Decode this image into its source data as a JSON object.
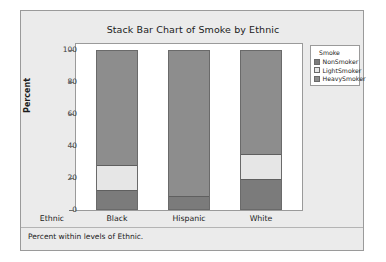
{
  "chart_data": {
    "type": "bar",
    "stacked": true,
    "stack_total": 100,
    "title": "Stack Bar Chart of Smoke by Ethnic",
    "xlabel": "Ethnic",
    "ylabel": "Percent",
    "categories": [
      "Black",
      "Hispanic",
      "White"
    ],
    "ylim": [
      0,
      100
    ],
    "yticks": [
      0,
      20,
      40,
      60,
      80,
      100
    ],
    "ytick_labels": [
      "0",
      "20",
      "40",
      "60",
      "80",
      "100"
    ],
    "grid": false,
    "legend_position": "right",
    "legend_title": "Smoke",
    "series": [
      {
        "name": "NonSmoker",
        "color": "#7b7b7b",
        "values": [
          12,
          8,
          19
        ]
      },
      {
        "name": "LightSmoker",
        "color": "#e6e6e6",
        "values": [
          16,
          0,
          16
        ]
      },
      {
        "name": "HeavySmoker",
        "color": "#8d8d8d",
        "values": [
          72,
          92,
          65
        ]
      }
    ],
    "footnote": "Percent within levels of Ethnic."
  },
  "chart": {
    "title": "Stack Bar Chart of Smoke by Ethnic",
    "y_axis_title": "Percent",
    "x_axis_row_label": "Ethnic",
    "footnote": "Percent within levels of Ethnic.",
    "y_ticks": [
      "100",
      "80",
      "60",
      "40",
      "20",
      "0"
    ],
    "categories": [
      "Black",
      "Hispanic",
      "White"
    ],
    "legend": {
      "title": "Smoke",
      "items": [
        {
          "label": "NonSmoker",
          "color": "#7b7b7b"
        },
        {
          "label": "LightSmoker",
          "color": "#e6e6e6"
        },
        {
          "label": "HeavySmoker",
          "color": "#8d8d8d"
        }
      ]
    },
    "colors": {
      "panel_background": "#ebebeb",
      "plot_background": "#ffffff",
      "frame_border": "#9a9a9a",
      "bar_border": "#6a6a6a",
      "text": "#1b1b1b"
    }
  }
}
